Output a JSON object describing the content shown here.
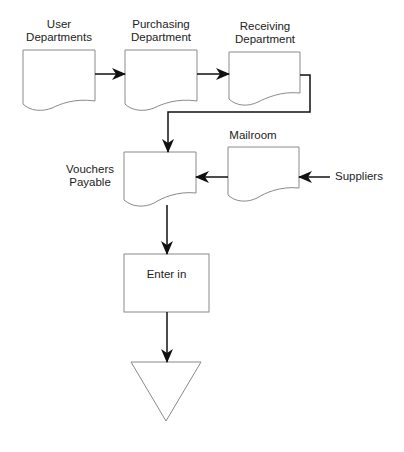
{
  "diagram": {
    "type": "flowchart",
    "nodes": [
      {
        "id": "user_departments",
        "shape": "document",
        "label_lines": [
          "User",
          "Departments"
        ]
      },
      {
        "id": "purchasing_department",
        "shape": "document",
        "label_lines": [
          "Purchasing",
          "Department"
        ]
      },
      {
        "id": "receiving_department",
        "shape": "document",
        "label_lines": [
          "Receiving",
          "Department"
        ]
      },
      {
        "id": "mailroom",
        "shape": "document",
        "label_lines": [
          "Mailroom"
        ]
      },
      {
        "id": "vouchers_payable",
        "shape": "document",
        "label_lines": [
          "Vouchers",
          "Payable"
        ]
      },
      {
        "id": "suppliers",
        "shape": "external-label",
        "label_lines": [
          "Suppliers"
        ]
      },
      {
        "id": "enter_in",
        "shape": "process",
        "label_lines": [
          "Enter in"
        ]
      },
      {
        "id": "file",
        "shape": "offline-storage-triangle",
        "label_lines": []
      }
    ],
    "edges": [
      {
        "from": "user_departments",
        "to": "purchasing_department"
      },
      {
        "from": "purchasing_department",
        "to": "receiving_department"
      },
      {
        "from": "receiving_department",
        "to": "vouchers_payable"
      },
      {
        "from": "suppliers",
        "to": "mailroom"
      },
      {
        "from": "mailroom",
        "to": "vouchers_payable"
      },
      {
        "from": "vouchers_payable",
        "to": "enter_in"
      },
      {
        "from": "enter_in",
        "to": "file"
      }
    ]
  },
  "labels": {
    "user_departments": [
      "User",
      "Departments"
    ],
    "purchasing_department": [
      "Purchasing",
      "Department"
    ],
    "receiving_department": [
      "Receiving",
      "Department"
    ],
    "mailroom": "Mailroom",
    "vouchers_payable": [
      "Vouchers",
      "Payable"
    ],
    "suppliers": "Suppliers",
    "enter_in": "Enter in"
  },
  "colors": {
    "shape_stroke": "#8a8a8a",
    "connector": "#111111",
    "text": "#222222"
  }
}
